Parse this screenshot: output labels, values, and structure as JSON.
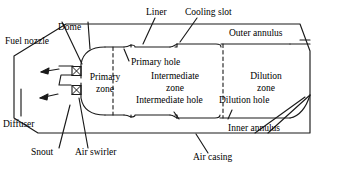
{
  "diagram": {
    "type": "engineering-cross-section",
    "stroke_color": "#1a1a1a",
    "background_color": "#ffffff",
    "labels": {
      "fuel_nozzle": "Fuel nozzle",
      "dome": "Dome",
      "liner": "Liner",
      "cooling_slot": "Cooling slot",
      "outer_annulus": "Outer annulus",
      "primary_hole": "Primary hole",
      "primary_zone_line1": "Primary",
      "primary_zone_line2": "zone",
      "intermediate_zone_line1": "Intermediate",
      "intermediate_zone_line2": "zone",
      "intermediate_hole": "Intermediate hole",
      "dilution_zone_line1": "Dilution",
      "dilution_zone_line2": "zone",
      "dilution_hole": "Dilution hole",
      "inner_annulus": "Inner annulus",
      "air_casing": "Air casing",
      "air_swirler": "Air swirler",
      "snout": "Snout",
      "diffuser": "Diffuser"
    },
    "components": [
      "air-casing",
      "diffuser",
      "snout",
      "fuel-nozzle",
      "air-swirler",
      "dome",
      "liner",
      "cooling-slot",
      "outer-annulus",
      "inner-annulus",
      "primary-zone",
      "intermediate-zone",
      "dilution-zone",
      "primary-hole",
      "intermediate-hole",
      "dilution-hole"
    ]
  }
}
